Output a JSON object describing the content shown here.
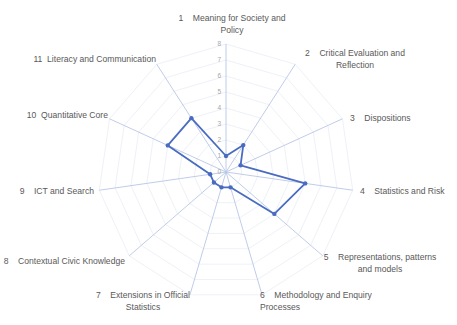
{
  "chart_data": {
    "type": "radar",
    "title": "",
    "categories": [
      "1  Meaning for Society and Policy",
      "2  Critical Evaluation and Reflection",
      "3  Dispositions",
      "4  Statistics and Risk",
      "5  Representations, patterns and models",
      "6  Methodology and Enquiry Processes",
      "7  Extensions in Official Statistics",
      "8  Contextual Civic Knowledge",
      "9  ICT and Search",
      "10  Quantitative Core",
      "11  Literacy and Communication"
    ],
    "series": [
      {
        "name": "Series 1",
        "values": [
          1,
          2,
          1,
          5,
          4,
          1,
          1,
          1,
          1,
          4,
          4
        ],
        "color": "#4a6cc0"
      }
    ],
    "rlim": [
      0,
      8
    ],
    "ticks": [
      "0",
      "1",
      "2",
      "3",
      "4",
      "5",
      "6",
      "7",
      "8"
    ],
    "grid": true,
    "legend": "none"
  },
  "labels": [
    {
      "lines": [
        "1    Meaning for Society and",
        "Policy"
      ],
      "x": 232,
      "y": 21,
      "anchor": "middle"
    },
    {
      "lines": [
        "2    Critical Evaluation and",
        "Reflection"
      ],
      "x": 355,
      "y": 56,
      "anchor": "middle"
    },
    {
      "lines": [
        "3    Dispositions"
      ],
      "x": 350,
      "y": 121,
      "anchor": "start"
    },
    {
      "lines": [
        "4    Statistics and Risk"
      ],
      "x": 360,
      "y": 194,
      "anchor": "start"
    },
    {
      "lines": [
        "5    Representations, patterns",
        "and models"
      ],
      "x": 380,
      "y": 260,
      "anchor": "middle"
    },
    {
      "lines": [
        "6    Methodology and Enquiry",
        "Processes"
      ],
      "x": 260,
      "y": 298,
      "anchor": "start"
    },
    {
      "lines": [
        "7    Extensions in Official",
        "Statistics"
      ],
      "x": 143,
      "y": 298,
      "anchor": "middle"
    },
    {
      "lines": [
        "8    Contextual Civic Knowledge"
      ],
      "x": 125,
      "y": 264,
      "anchor": "end"
    },
    {
      "lines": [
        "9    ICT and Search"
      ],
      "x": 94,
      "y": 194,
      "anchor": "end"
    },
    {
      "lines": [
        "10  Quantitative Core"
      ],
      "x": 108,
      "y": 118,
      "anchor": "end"
    },
    {
      "lines": [
        "11  Literacy and Communication"
      ],
      "x": 156,
      "y": 62,
      "anchor": "end"
    }
  ],
  "colors": {
    "spoke": "#b8c6e6",
    "grid": "#eef1f7",
    "series": "#4a6cc0",
    "label": "#595959",
    "tick": "#a6a6a6"
  }
}
